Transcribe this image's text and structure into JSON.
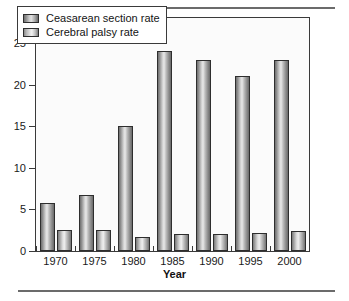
{
  "chart_data": {
    "type": "bar",
    "title": "",
    "subtitle": "",
    "xlabel": "Year",
    "ylabel": "",
    "categories": [
      "1970",
      "1975",
      "1980",
      "1985",
      "1990",
      "1995",
      "2000"
    ],
    "series": [
      {
        "name": "Ceasarean section rate",
        "values": [
          5.8,
          6.7,
          15.0,
          24.0,
          23.0,
          21.0,
          23.0
        ]
      },
      {
        "name": "Cerebral palsy rate",
        "values": [
          2.5,
          2.5,
          1.7,
          2.0,
          2.1,
          2.2,
          2.4
        ]
      }
    ],
    "ylim": [
      0,
      28
    ],
    "yticks": [
      "0",
      "5",
      "10",
      "15",
      "20",
      "25"
    ],
    "ytick_values": [
      0,
      5,
      10,
      15,
      20,
      25
    ],
    "grid": false,
    "legend_position": "top-left",
    "bar_colors": [
      "#9a9a9a",
      "#c4c4c4"
    ],
    "bar_edge_color": "#2e2e2e",
    "frame_color": "#3a3a3a",
    "background": "#fbfbfb"
  },
  "legend": {
    "entries": [
      {
        "label": "Ceasarean section rate"
      },
      {
        "label": "Cerebral palsy rate"
      }
    ]
  },
  "axes": {
    "x_title": "Year"
  }
}
